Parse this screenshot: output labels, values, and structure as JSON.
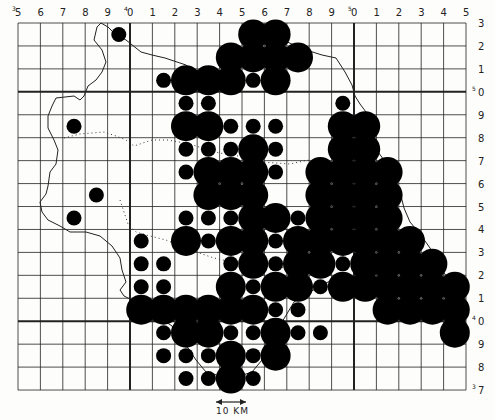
{
  "map": {
    "type": "distribution-grid-map",
    "column_labels": [
      {
        "prefix": "3",
        "digit": "5"
      },
      {
        "prefix": "",
        "digit": "6"
      },
      {
        "prefix": "",
        "digit": "7"
      },
      {
        "prefix": "",
        "digit": "8"
      },
      {
        "prefix": "",
        "digit": "9"
      },
      {
        "prefix": "4",
        "digit": "0"
      },
      {
        "prefix": "",
        "digit": "1"
      },
      {
        "prefix": "",
        "digit": "2"
      },
      {
        "prefix": "",
        "digit": "3"
      },
      {
        "prefix": "",
        "digit": "4"
      },
      {
        "prefix": "",
        "digit": "5"
      },
      {
        "prefix": "",
        "digit": "6"
      },
      {
        "prefix": "",
        "digit": "7"
      },
      {
        "prefix": "",
        "digit": "8"
      },
      {
        "prefix": "",
        "digit": "9"
      },
      {
        "prefix": "5",
        "digit": "0"
      },
      {
        "prefix": "",
        "digit": "1"
      },
      {
        "prefix": "",
        "digit": "2"
      },
      {
        "prefix": "",
        "digit": "3"
      },
      {
        "prefix": "",
        "digit": "4"
      },
      {
        "prefix": "",
        "digit": "5"
      }
    ],
    "row_labels": [
      {
        "prefix": "",
        "digit": "3"
      },
      {
        "prefix": "",
        "digit": "2"
      },
      {
        "prefix": "",
        "digit": "1"
      },
      {
        "prefix": "5",
        "digit": "0"
      },
      {
        "prefix": "",
        "digit": "9"
      },
      {
        "prefix": "",
        "digit": "8"
      },
      {
        "prefix": "",
        "digit": "7"
      },
      {
        "prefix": "",
        "digit": "6"
      },
      {
        "prefix": "",
        "digit": "5"
      },
      {
        "prefix": "",
        "digit": "4"
      },
      {
        "prefix": "",
        "digit": "3"
      },
      {
        "prefix": "",
        "digit": "2"
      },
      {
        "prefix": "",
        "digit": "1"
      },
      {
        "prefix": "4",
        "digit": "0"
      },
      {
        "prefix": "",
        "digit": "9"
      },
      {
        "prefix": "",
        "digit": "8"
      },
      {
        "prefix": "3",
        "digit": "7"
      }
    ],
    "thick_columns": [
      5,
      15
    ],
    "thick_rows": [
      3,
      13
    ],
    "scale_label": "10 KM",
    "legend": {
      "L": "large dot (major record)",
      "S": "small dot (minor record)"
    },
    "records": [
      "....S.....LL........",
      ".........LLLL.......",
      "......SLLLSL........",
      ".......SS.....S.....",
      "..S....LLSSS..LL....",
      ".......SSSLS..LL....",
      ".......SLLLS.LLLL...",
      "...S....LLL..LLLL...",
      "..S....SSSLLSLLLL...",
      ".....S.LSLLSLLLLLL..",
      ".....SS..SLSLLSLLLL.",
      ".....SS..LSLLSLLLLLL",
      ".....LLLLLLSS...LLLL",
      "......SLLSSLSS.....L",
      "......SSSLSL........",
      ".......SSLS........."
    ]
  }
}
